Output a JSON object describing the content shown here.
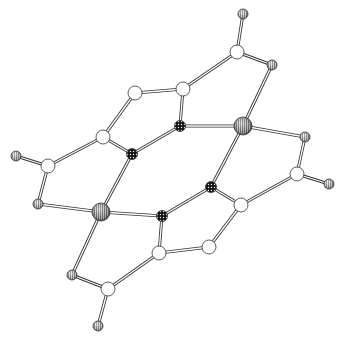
{
  "diagram": {
    "type": "ball-and-stick molecular structure",
    "background": "#ffffff",
    "colors": {
      "stroke": "#333333",
      "bond_fill": "#ffffff",
      "carbon": "#ffffff",
      "nitrogen": "#111111",
      "oxygen": "#9a9a9a",
      "metal": "#6e6e6e"
    },
    "atoms": [
      {
        "id": "Me1",
        "kind": "methyl",
        "x": 243,
        "y": 14,
        "r": 5
      },
      {
        "id": "C1",
        "kind": "carbon",
        "x": 237,
        "y": 52,
        "r": 7
      },
      {
        "id": "O1",
        "kind": "oxygen",
        "x": 272,
        "y": 65,
        "r": 5
      },
      {
        "id": "C2",
        "kind": "carbon",
        "x": 183,
        "y": 89,
        "r": 7
      },
      {
        "id": "C3",
        "kind": "carbon",
        "x": 135,
        "y": 93,
        "r": 7
      },
      {
        "id": "N1",
        "kind": "nitrogen",
        "x": 180,
        "y": 126,
        "r": 5.5
      },
      {
        "id": "M1",
        "kind": "metal",
        "x": 243,
        "y": 126,
        "r": 9
      },
      {
        "id": "O2",
        "kind": "oxygen",
        "x": 305,
        "y": 137,
        "r": 5
      },
      {
        "id": "C4",
        "kind": "carbon",
        "x": 103,
        "y": 137,
        "r": 7
      },
      {
        "id": "N2",
        "kind": "nitrogen",
        "x": 132,
        "y": 154,
        "r": 5.5
      },
      {
        "id": "C5",
        "kind": "carbon",
        "x": 48,
        "y": 166,
        "r": 7
      },
      {
        "id": "Me2",
        "kind": "methyl",
        "x": 16,
        "y": 156,
        "r": 5
      },
      {
        "id": "C6",
        "kind": "carbon",
        "x": 297,
        "y": 174,
        "r": 7
      },
      {
        "id": "Me3",
        "kind": "methyl",
        "x": 329,
        "y": 184,
        "r": 5
      },
      {
        "id": "N3",
        "kind": "nitrogen",
        "x": 211,
        "y": 187,
        "r": 5.5
      },
      {
        "id": "O3",
        "kind": "oxygen",
        "x": 38,
        "y": 204,
        "r": 5
      },
      {
        "id": "M2",
        "kind": "metal",
        "x": 101,
        "y": 212,
        "r": 9
      },
      {
        "id": "N4",
        "kind": "nitrogen",
        "x": 162,
        "y": 216,
        "r": 5.5
      },
      {
        "id": "C7",
        "kind": "carbon",
        "x": 241,
        "y": 205,
        "r": 7
      },
      {
        "id": "C8",
        "kind": "carbon",
        "x": 209,
        "y": 247,
        "r": 7
      },
      {
        "id": "C9",
        "kind": "carbon",
        "x": 159,
        "y": 253,
        "r": 7
      },
      {
        "id": "O4",
        "kind": "oxygen",
        "x": 72,
        "y": 275,
        "r": 5
      },
      {
        "id": "C10",
        "kind": "carbon",
        "x": 108,
        "y": 289,
        "r": 7
      },
      {
        "id": "Me4",
        "kind": "methyl",
        "x": 98,
        "y": 326,
        "r": 5
      }
    ],
    "bonds": [
      [
        "Me1",
        "C1"
      ],
      [
        "C1",
        "O1"
      ],
      [
        "C1",
        "C2"
      ],
      [
        "O1",
        "M1"
      ],
      [
        "C2",
        "C3"
      ],
      [
        "C2",
        "N1"
      ],
      [
        "C3",
        "C4"
      ],
      [
        "N1",
        "M1"
      ],
      [
        "N1",
        "N2"
      ],
      [
        "C4",
        "N2"
      ],
      [
        "C4",
        "C5"
      ],
      [
        "C5",
        "Me2"
      ],
      [
        "C5",
        "O3"
      ],
      [
        "M1",
        "O2"
      ],
      [
        "M1",
        "N3"
      ],
      [
        "O2",
        "C6"
      ],
      [
        "C6",
        "Me3"
      ],
      [
        "C6",
        "C7"
      ],
      [
        "N3",
        "C7"
      ],
      [
        "N3",
        "N4"
      ],
      [
        "C7",
        "C8"
      ],
      [
        "C8",
        "C9"
      ],
      [
        "C9",
        "N4"
      ],
      [
        "N2",
        "M2"
      ],
      [
        "O3",
        "M2"
      ],
      [
        "M2",
        "N4"
      ],
      [
        "M2",
        "O4"
      ],
      [
        "O4",
        "C10"
      ],
      [
        "C10",
        "C9"
      ],
      [
        "C10",
        "Me4"
      ]
    ]
  }
}
